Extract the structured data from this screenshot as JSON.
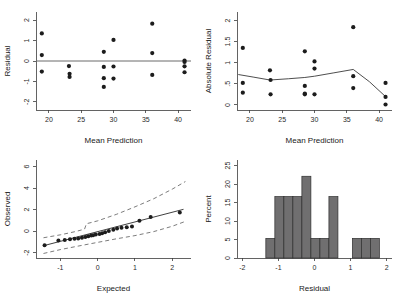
{
  "figure": {
    "background": "#ffffff",
    "width": 402,
    "height": 296,
    "point_color": "#1c1c1c",
    "bar_fill": "#706f70",
    "bar_stroke": "#2e2e2e",
    "line_color": "#3a3a3a",
    "refline_color": "#6b6b6b"
  },
  "chart_data": [
    {
      "id": "residual-vs-prediction",
      "type": "scatter",
      "title": "",
      "xlabel": "Mean Prediction",
      "ylabel": "Residual",
      "xlim": [
        18.0,
        42.0
      ],
      "ylim": [
        -2.4,
        2.4
      ],
      "xticks": [
        20,
        25,
        30,
        35,
        40
      ],
      "xticklabels": [
        "20",
        "25",
        "30",
        "35",
        "40"
      ],
      "yticks": [
        -2,
        -1,
        0,
        1,
        2
      ],
      "yticklabels": [
        "-2",
        "-1",
        "0",
        "1",
        "2"
      ],
      "grid": false,
      "legend": "none",
      "reference_line": {
        "type": "horizontal",
        "y": 0
      },
      "x": [
        18.9,
        18.9,
        18.9,
        23.1,
        23.2,
        23.2,
        28.5,
        28.5,
        28.5,
        28.5,
        30.0,
        30.0,
        30.0,
        36.0,
        36.0,
        36.0,
        41.0,
        41.0,
        41.0,
        41.0
      ],
      "y": [
        1.35,
        0.29,
        -0.52,
        -0.25,
        -0.63,
        -0.78,
        0.45,
        -0.29,
        -0.84,
        -1.27,
        1.03,
        -0.27,
        -0.86,
        1.83,
        0.39,
        -0.68,
        0.02,
        -0.05,
        -0.26,
        -0.55
      ]
    },
    {
      "id": "absolute-residual-vs-prediction",
      "type": "scatter",
      "title": "",
      "xlabel": "Mean Prediction",
      "ylabel": "Absolute Residual",
      "xlim": [
        18.0,
        42.0
      ],
      "ylim": [
        -0.12,
        2.2
      ],
      "xticks": [
        20,
        25,
        30,
        35,
        40
      ],
      "xticklabels": [
        "20",
        "25",
        "30",
        "35",
        "40"
      ],
      "yticks": [
        0,
        0.5,
        1,
        1.5,
        2
      ],
      "yticklabels": [
        "0",
        ".5",
        "1",
        "1.5",
        "2"
      ],
      "grid": false,
      "legend": "none",
      "x": [
        18.9,
        18.9,
        18.9,
        23.1,
        23.2,
        23.2,
        28.5,
        28.5,
        28.5,
        28.5,
        30.0,
        30.0,
        30.0,
        36.0,
        36.0,
        36.0,
        41.0,
        41.0,
        41.0
      ],
      "y": [
        1.35,
        0.52,
        0.29,
        0.82,
        0.59,
        0.25,
        1.27,
        0.45,
        0.27,
        0.25,
        1.03,
        0.86,
        0.25,
        1.84,
        0.68,
        0.4,
        0.52,
        0.19,
        0.01
      ],
      "smooth_line": {
        "name": "lowess",
        "x": [
          18.2,
          20.5,
          23.1,
          26.0,
          28.5,
          30.0,
          33.0,
          36.0,
          38.5,
          41.2
        ],
        "y": [
          0.72,
          0.66,
          0.59,
          0.62,
          0.65,
          0.68,
          0.76,
          0.84,
          0.55,
          0.17
        ]
      }
    },
    {
      "id": "normal-probability-plot",
      "type": "scatter",
      "title": "",
      "xlabel": "Expected",
      "ylabel": "Observed",
      "xlim": [
        -1.65,
        2.5
      ],
      "ylim": [
        -2.5,
        6.6
      ],
      "xticks": [
        -1,
        0,
        1,
        2
      ],
      "xticklabels": [
        "-1",
        "0",
        "1",
        "2"
      ],
      "yticks": [
        -2,
        0,
        2,
        4,
        6
      ],
      "yticklabels": [
        "-2",
        "0",
        "2",
        "4",
        "6"
      ],
      "grid": false,
      "legend": "none",
      "x": [
        -1.42,
        -1.05,
        -0.88,
        -0.74,
        -0.62,
        -0.52,
        -0.42,
        -0.33,
        -0.25,
        -0.17,
        -0.12,
        -0.05,
        0.05,
        0.12,
        0.2,
        0.3,
        0.42,
        0.52,
        0.64,
        0.78,
        0.92,
        1.12,
        1.42,
        2.2
      ],
      "y": [
        -1.32,
        -0.88,
        -0.82,
        -0.76,
        -0.72,
        -0.68,
        -0.62,
        -0.55,
        -0.48,
        -0.42,
        -0.38,
        -0.32,
        -0.28,
        -0.2,
        -0.12,
        0.0,
        0.12,
        0.25,
        0.3,
        0.35,
        0.42,
        0.95,
        1.3,
        1.72
      ],
      "fit_line": {
        "name": "reference-fit",
        "x": [
          -1.45,
          2.3
        ],
        "y": [
          -1.36,
          2.02
        ]
      },
      "upper_band": {
        "name": "upper-confidence-band",
        "x": [
          -1.45,
          -1.0,
          -0.6,
          -0.35,
          -0.3,
          0.0,
          0.5,
          1.0,
          1.5,
          2.0,
          2.35
        ],
        "y": [
          -0.62,
          -0.35,
          -0.05,
          0.18,
          0.68,
          0.95,
          1.55,
          2.25,
          3.0,
          3.9,
          4.6
        ]
      },
      "lower_band": {
        "name": "lower-confidence-band",
        "x": [
          -1.45,
          -1.0,
          -0.5,
          0.0,
          0.5,
          1.0,
          1.5,
          2.0,
          2.35
        ],
        "y": [
          -2.08,
          -1.72,
          -1.38,
          -1.05,
          -0.72,
          -0.42,
          -0.05,
          0.45,
          0.9
        ]
      }
    },
    {
      "id": "residual-histogram",
      "type": "bar",
      "title": "",
      "xlabel": "Residual",
      "ylabel": "Percent",
      "xlim": [
        -2.15,
        2.15
      ],
      "ylim": [
        0,
        26.5
      ],
      "xticks": [
        -2,
        -1,
        0,
        1,
        2
      ],
      "xticklabels": [
        "-2",
        "-1",
        "0",
        "1",
        "2"
      ],
      "yticks": [
        0,
        5,
        10,
        15,
        20,
        25
      ],
      "yticklabels": [
        "0",
        "5",
        "10",
        "15",
        "20",
        "25"
      ],
      "grid": false,
      "legend": "none",
      "bin_width": 0.25,
      "bin_edges": [
        -1.35,
        -1.1,
        -0.85,
        -0.6,
        -0.35,
        -0.1,
        0.15,
        0.4,
        0.65,
        1.05,
        1.3,
        1.55,
        1.8
      ],
      "categories": [
        "-1.35..-1.10",
        "-1.10..-0.85",
        "-0.85..-0.60",
        "-0.60..-0.35",
        "-0.35..-0.10",
        "-0.10..0.15",
        "0.15..0.40",
        "0.40..0.65",
        "1.05..1.30",
        "1.30..1.55",
        "1.55..1.80"
      ],
      "values": [
        5.3,
        16.6,
        16.6,
        16.6,
        22.1,
        5.3,
        5.3,
        16.6,
        5.3,
        5.3,
        5.3
      ],
      "bars": [
        {
          "x0": -1.35,
          "x1": -1.1,
          "value": 5.3
        },
        {
          "x0": -1.1,
          "x1": -0.85,
          "value": 16.6
        },
        {
          "x0": -0.85,
          "x1": -0.6,
          "value": 16.6
        },
        {
          "x0": -0.6,
          "x1": -0.35,
          "value": 16.6
        },
        {
          "x0": -0.35,
          "x1": -0.1,
          "value": 22.1
        },
        {
          "x0": -0.1,
          "x1": 0.15,
          "value": 5.3
        },
        {
          "x0": 0.15,
          "x1": 0.4,
          "value": 5.3
        },
        {
          "x0": 0.4,
          "x1": 0.65,
          "value": 16.6
        },
        {
          "x0": 1.05,
          "x1": 1.3,
          "value": 5.3
        },
        {
          "x0": 1.3,
          "x1": 1.55,
          "value": 5.3
        },
        {
          "x0": 1.55,
          "x1": 1.8,
          "value": 5.3
        }
      ]
    }
  ]
}
